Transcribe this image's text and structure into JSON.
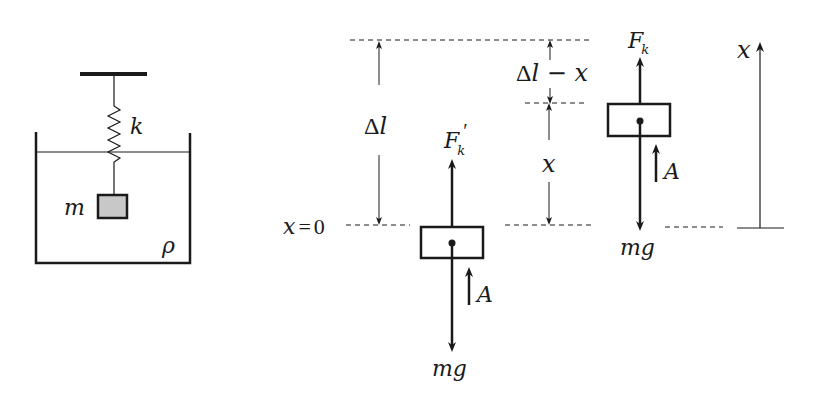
{
  "colors": {
    "ink": "#1a1a1a",
    "mass_fill": "#c8c8c8",
    "background": "#ffffff"
  },
  "setup": {
    "spring_label": "k",
    "mass_label": "m",
    "fluid_density_label": "ρ"
  },
  "equilibrium_state": {
    "origin_label": "x = 0",
    "origin_x": "x",
    "origin_eq": "=",
    "origin_zero": "0",
    "extension_label_delta": "Δ",
    "extension_label_l": "l",
    "spring_force_label": "F",
    "spring_force_sub": "k",
    "spring_force_prime": "′",
    "buoyancy_label": "A",
    "weight_label": "mg"
  },
  "displaced_state": {
    "spring_force_label": "F",
    "spring_force_sub": "k",
    "buoyancy_label": "A",
    "weight_label": "mg",
    "remaining_extension_delta": "Δ",
    "remaining_extension_rest": "l − x",
    "displacement_label": "x"
  },
  "axis": {
    "label": "x"
  }
}
